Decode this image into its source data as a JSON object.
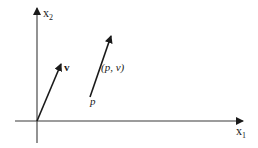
{
  "diagram": {
    "type": "vector-diagram",
    "axes": {
      "x_axis_label": "x",
      "x_axis_subscript": "1",
      "y_axis_label": "x",
      "y_axis_subscript": "2"
    },
    "vectors": [
      {
        "id": "v",
        "label": "v",
        "from": "origin"
      },
      {
        "id": "pv",
        "label": "(p, v)",
        "from": "p",
        "base_label": "p"
      }
    ],
    "colors": {
      "stroke": "#1a1a1a",
      "background": "#ffffff"
    }
  }
}
